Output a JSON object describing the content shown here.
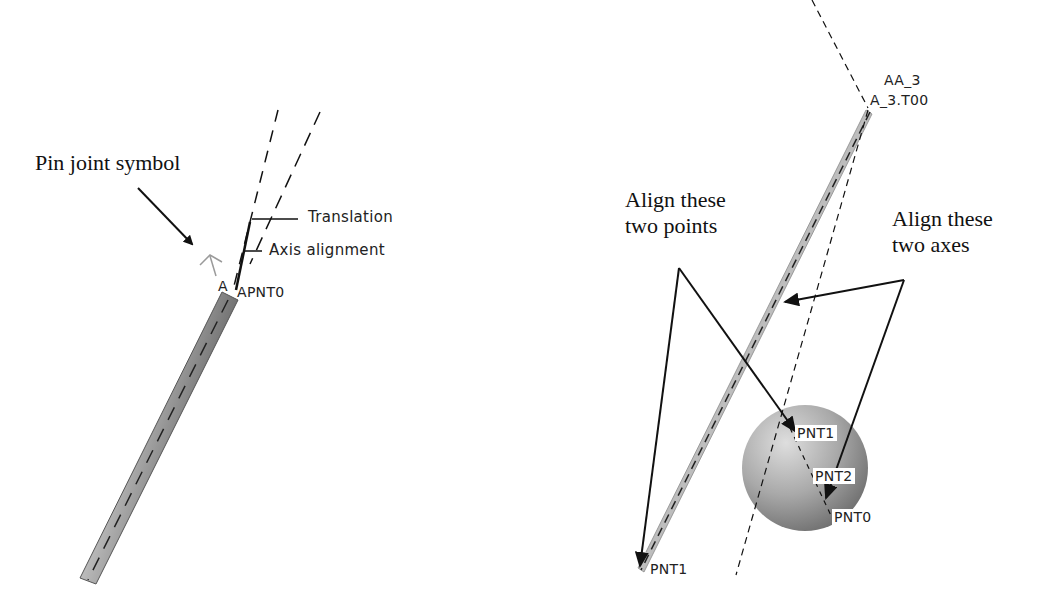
{
  "left_panel": {
    "callout": "Pin joint symbol",
    "leader_labels": {
      "translation": "Translation",
      "axis_alignment": "Axis alignment"
    },
    "point_labels": {
      "axis_a": "A",
      "pnt": "APNT0"
    }
  },
  "right_panel": {
    "callout_points": [
      "Align these",
      "two points"
    ],
    "callout_axes": [
      "Align these",
      "two axes"
    ],
    "top_labels": {
      "axis": "AA_3",
      "point": "A_3.T00"
    },
    "point_labels": {
      "sphere_pnt1": "PNT1",
      "sphere_pnt2": "PNT2",
      "sphere_pnt0": "PNT0",
      "rod_pnt1": "PNT1"
    }
  },
  "colors": {
    "ink": "#111111",
    "rod_fill": "#a8a8a8",
    "sphere_light": "#d8d8d8",
    "sphere_dark": "#6e6e6e"
  }
}
